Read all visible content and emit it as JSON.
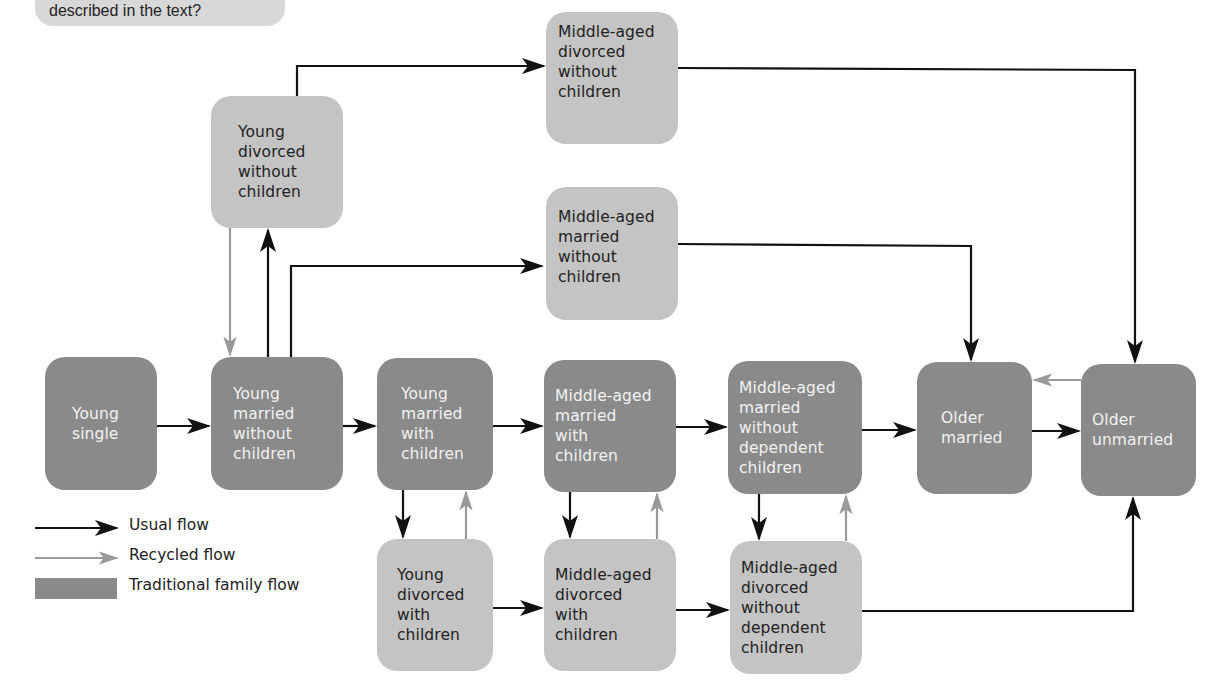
{
  "callout": {
    "text": "described in the text?"
  },
  "colors": {
    "traditional_fill": "#8a8a8a",
    "alternative_fill": "#c4c4c4",
    "usual_flow": "#111111",
    "recycled_flow": "#999999"
  },
  "nodes": {
    "young_single": {
      "lines": [
        "Young",
        "single"
      ],
      "type": "traditional"
    },
    "young_married_no_children": {
      "lines": [
        "Young",
        "married",
        "without",
        "children"
      ],
      "type": "traditional"
    },
    "young_divorced_no_children": {
      "lines": [
        "Young",
        "divorced",
        "without",
        "children"
      ],
      "type": "alternative"
    },
    "middle_divorced_no_children": {
      "lines": [
        "Middle-aged",
        "divorced",
        "without",
        "children"
      ],
      "type": "alternative"
    },
    "middle_married_no_children": {
      "lines": [
        "Middle-aged",
        "married",
        "without",
        "children"
      ],
      "type": "alternative"
    },
    "young_married_with_children": {
      "lines": [
        "Young",
        "married",
        "with",
        "children"
      ],
      "type": "traditional"
    },
    "middle_married_with_children": {
      "lines": [
        "Middle-aged",
        "married",
        "with",
        "children"
      ],
      "type": "traditional"
    },
    "middle_married_no_dependent": {
      "lines": [
        "Middle-aged",
        "married",
        "without",
        "dependent",
        "children"
      ],
      "type": "traditional"
    },
    "older_married": {
      "lines": [
        "Older",
        "married"
      ],
      "type": "traditional"
    },
    "older_unmarried": {
      "lines": [
        "Older",
        "unmarried"
      ],
      "type": "traditional"
    },
    "young_divorced_with_children": {
      "lines": [
        "Young",
        "divorced",
        "with",
        "children"
      ],
      "type": "alternative"
    },
    "middle_divorced_with_children": {
      "lines": [
        "Middle-aged",
        "divorced",
        "with",
        "children"
      ],
      "type": "alternative"
    },
    "middle_divorced_no_dependent": {
      "lines": [
        "Middle-aged",
        "divorced",
        "without",
        "dependent",
        "children"
      ],
      "type": "alternative"
    }
  },
  "edges": [
    {
      "from": "Young single",
      "to": "Young married without children",
      "flow": "usual"
    },
    {
      "from": "Young married without children",
      "to": "Young married with children",
      "flow": "usual"
    },
    {
      "from": "Young married without children",
      "to": "Young divorced without children",
      "flow": "usual"
    },
    {
      "from": "Young divorced without children",
      "to": "Young married without children",
      "flow": "recycled"
    },
    {
      "from": "Young married without children",
      "to": "Middle-aged married without children",
      "flow": "usual"
    },
    {
      "from": "Young divorced without children",
      "to": "Middle-aged divorced without children",
      "flow": "usual"
    },
    {
      "from": "Middle-aged divorced without children",
      "to": "Older unmarried",
      "flow": "usual"
    },
    {
      "from": "Middle-aged married without children",
      "to": "Older married",
      "flow": "usual"
    },
    {
      "from": "Young married with children",
      "to": "Middle-aged married with children",
      "flow": "usual"
    },
    {
      "from": "Middle-aged married with children",
      "to": "Middle-aged married without dependent children",
      "flow": "usual"
    },
    {
      "from": "Middle-aged married without dependent children",
      "to": "Older married",
      "flow": "usual"
    },
    {
      "from": "Older married",
      "to": "Older unmarried",
      "flow": "usual"
    },
    {
      "from": "Older unmarried",
      "to": "Older married",
      "flow": "recycled"
    },
    {
      "from": "Young married with children",
      "to": "Young divorced with children",
      "flow": "usual"
    },
    {
      "from": "Young divorced with children",
      "to": "Young married with children",
      "flow": "recycled"
    },
    {
      "from": "Middle-aged married with children",
      "to": "Middle-aged divorced with children",
      "flow": "usual"
    },
    {
      "from": "Middle-aged divorced with children",
      "to": "Middle-aged married with children",
      "flow": "recycled"
    },
    {
      "from": "Middle-aged married without dependent children",
      "to": "Middle-aged divorced without dependent children",
      "flow": "usual"
    },
    {
      "from": "Middle-aged divorced without dependent children",
      "to": "Middle-aged married without dependent children",
      "flow": "recycled"
    },
    {
      "from": "Young divorced with children",
      "to": "Middle-aged divorced with children",
      "flow": "usual"
    },
    {
      "from": "Middle-aged divorced with children",
      "to": "Middle-aged divorced without dependent children",
      "flow": "usual"
    },
    {
      "from": "Middle-aged divorced without dependent children",
      "to": "Older unmarried",
      "flow": "usual"
    }
  ],
  "legend": {
    "usual": "Usual flow",
    "recycled": "Recycled flow",
    "traditional": "Traditional family flow"
  }
}
